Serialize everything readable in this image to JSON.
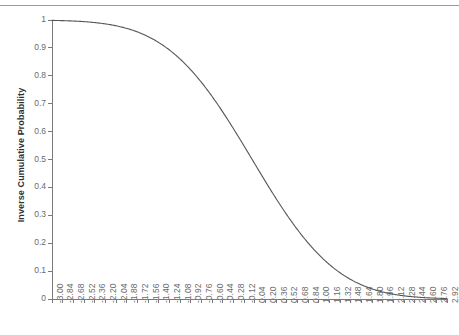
{
  "figure": {
    "background_color": "#ffffff",
    "top_rule_color": "#9a9a9c",
    "axis_color": "#7a7a7c",
    "curve_color": "#555557",
    "tick_text_color": "#6a6a6c",
    "axis_title_color": "#2f2f31"
  },
  "chart_data": {
    "type": "line",
    "title": "",
    "subtitle": "",
    "xlabel": "",
    "ylabel": "Inverse Cumulative Probability",
    "xlim": [
      -3.0,
      2.92
    ],
    "ylim": [
      0,
      1
    ],
    "grid": false,
    "legend": "none",
    "ytick_labels": [
      "1",
      "0.9",
      "0.8",
      "0.7",
      "0.6",
      "0.5",
      "0.4",
      "0.3",
      "0.2",
      "0.1",
      "0"
    ],
    "ytick_values": [
      1,
      0.9,
      0.8,
      0.7,
      0.6,
      0.5,
      0.4,
      0.3,
      0.2,
      0.1,
      0
    ],
    "xtick_labels": [
      "-3.00",
      "-2.84",
      "-2.68",
      "-2.52",
      "-2.36",
      "-2.20",
      "-2.04",
      "-1.88",
      "-1.72",
      "-1.56",
      "-1.40",
      "-1.24",
      "-1.08",
      "-0.92",
      "-0.76",
      "-0.60",
      "-0.44",
      "-0.28",
      "-0.12",
      "0.04",
      "0.20",
      "0.36",
      "0.52",
      "0.68",
      "0.84",
      "1.00",
      "1.16",
      "1.32",
      "1.48",
      "1.64",
      "1.80",
      "1.96",
      "2.12",
      "2.28",
      "2.44",
      "2.60",
      "2.76",
      "2.92"
    ],
    "x": [
      -3.0,
      -2.84,
      -2.68,
      -2.52,
      -2.36,
      -2.2,
      -2.04,
      -1.88,
      -1.72,
      -1.56,
      -1.4,
      -1.24,
      -1.08,
      -0.92,
      -0.76,
      -0.6,
      -0.44,
      -0.28,
      -0.12,
      0.04,
      0.2,
      0.36,
      0.52,
      0.68,
      0.84,
      1.0,
      1.16,
      1.32,
      1.48,
      1.64,
      1.8,
      1.96,
      2.12,
      2.28,
      2.44,
      2.6,
      2.76,
      2.92
    ],
    "values": [
      0.9987,
      0.9977,
      0.9963,
      0.9941,
      0.9909,
      0.9861,
      0.9793,
      0.9699,
      0.9573,
      0.9406,
      0.9192,
      0.8925,
      0.8599,
      0.8212,
      0.7764,
      0.7257,
      0.67,
      0.6103,
      0.5478,
      0.484,
      0.4207,
      0.3594,
      0.3015,
      0.2483,
      0.2005,
      0.1587,
      0.123,
      0.0934,
      0.0694,
      0.0505,
      0.0359,
      0.025,
      0.017,
      0.0113,
      0.0073,
      0.0047,
      0.0029,
      0.0018
    ],
    "series": [
      {
        "name": "Inverse Cumulative Probability",
        "color": "#555557",
        "line_width": 1.1
      }
    ]
  }
}
